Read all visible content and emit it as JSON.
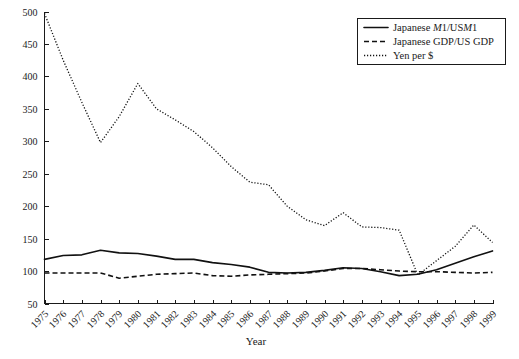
{
  "chart_data": {
    "type": "line",
    "title": "",
    "xlabel": "Year",
    "ylabel": "",
    "xlim": [
      1975,
      1999
    ],
    "ylim": [
      50,
      500
    ],
    "grid": false,
    "legend_position": "top-right",
    "x": [
      1975,
      1976,
      1977,
      1978,
      1979,
      1980,
      1981,
      1982,
      1983,
      1984,
      1985,
      1986,
      1987,
      1988,
      1989,
      1990,
      1991,
      1992,
      1993,
      1994,
      1995,
      1996,
      1997,
      1998,
      1999
    ],
    "y_ticks": [
      50,
      100,
      150,
      200,
      250,
      300,
      350,
      400,
      450,
      500
    ],
    "x_ticks": [
      "1975",
      "1976",
      "1977",
      "1978",
      "1979",
      "1980",
      "1981",
      "1982",
      "1983",
      "1984",
      "1985",
      "1986",
      "1987",
      "1988",
      "1989",
      "1990",
      "1991",
      "1992",
      "1993",
      "1994",
      "1995",
      "1996",
      "1997",
      "1998",
      "1999"
    ],
    "series": [
      {
        "name": "Japanese M1/US M1",
        "style": "solid",
        "values": [
          118,
          124,
          125,
          132,
          128,
          127,
          123,
          118,
          118,
          113,
          110,
          106,
          98,
          97,
          98,
          101,
          105,
          104,
          99,
          93,
          95,
          102,
          112,
          122,
          131
        ]
      },
      {
        "name": "Japanese GDP/US GDP",
        "style": "dashed",
        "values": [
          97,
          97,
          97,
          97,
          89,
          92,
          95,
          96,
          97,
          93,
          92,
          94,
          95,
          96,
          97,
          100,
          104,
          104,
          102,
          100,
          99,
          99,
          98,
          97,
          98
        ]
      },
      {
        "name": "Yen per $",
        "style": "dotted",
        "values": [
          497,
          425,
          360,
          298,
          338,
          389,
          350,
          333,
          315,
          290,
          261,
          237,
          233,
          200,
          179,
          170,
          190,
          168,
          167,
          163,
          94,
          116,
          138,
          171,
          144
        ]
      }
    ]
  },
  "legend": {
    "items": [
      {
        "label_plain_1": "Japanese ",
        "label_italic_1": "M",
        "label_plain_2": "1/US",
        "label_italic_2": "M",
        "label_plain_3": "1",
        "full": "Japanese M1/US M1",
        "style": "solid"
      },
      {
        "label_plain_1": "Japanese GDP/US GDP",
        "label_italic_1": "",
        "label_plain_2": "",
        "label_italic_2": "",
        "label_plain_3": "",
        "full": "Japanese GDP/US GDP",
        "style": "dashed"
      },
      {
        "label_plain_1": "Yen per $",
        "label_italic_1": "",
        "label_plain_2": "",
        "label_italic_2": "",
        "label_plain_3": "",
        "full": "Yen per $",
        "style": "dotted"
      }
    ]
  },
  "colors": {
    "line": "#111111",
    "axis": "#1a1a1a",
    "background": "#ffffff"
  }
}
